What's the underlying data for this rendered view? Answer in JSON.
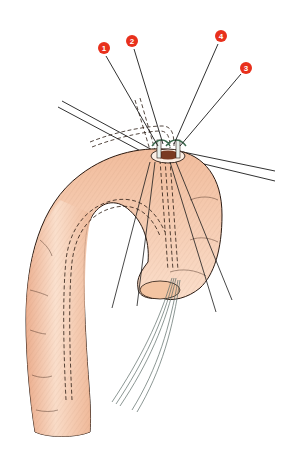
{
  "figure": {
    "colors": {
      "vessel_fill": "#f4c7a6",
      "vessel_highlight": "#fbe3d2",
      "vessel_shadow": "#e9a886",
      "outline": "#2a1a12",
      "suture": "#1a1a1a",
      "tourniquet": "#e8f0ec",
      "cannula": "#dfe8e6",
      "marker": "#e8301c",
      "marker_text": "#ffffff",
      "lumen": "#7a3a22"
    },
    "markers": [
      {
        "id": 1,
        "label": "1"
      },
      {
        "id": 2,
        "label": "2"
      },
      {
        "id": 3,
        "label": "3"
      },
      {
        "id": 4,
        "label": "4"
      }
    ]
  }
}
